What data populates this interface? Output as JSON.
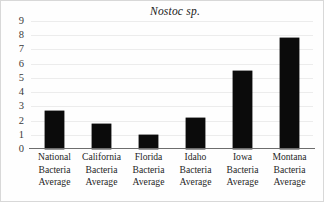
{
  "chart_data": {
    "type": "bar",
    "title": "Nostoc sp.",
    "xlabel": "",
    "ylabel": "",
    "ylim": [
      0,
      9
    ],
    "grid": true,
    "legend": "none",
    "y_ticks": [
      "0",
      "1",
      "2",
      "3",
      "4",
      "5",
      "6",
      "7",
      "8",
      "9"
    ],
    "categories": [
      "National Bacteria Average",
      "California Bacteria Average",
      "Florida Bacteria Average",
      "Idaho Bacteria Average",
      "Iowa Bacteria Average",
      "Montana Bacteria Average"
    ],
    "category_lines": [
      [
        "National",
        "Bacteria",
        "Average"
      ],
      [
        "California",
        "Bacteria",
        "Average"
      ],
      [
        "Florida",
        "Bacteria",
        "Average"
      ],
      [
        "Idaho",
        "Bacteria",
        "Average"
      ],
      [
        "Iowa",
        "Bacteria",
        "Average"
      ],
      [
        "Montana",
        "Bacteria",
        "Average"
      ]
    ],
    "values": [
      2.7,
      1.75,
      1.0,
      2.15,
      5.5,
      7.8
    ],
    "bar_color": "#0b0b0b",
    "gridline_color": "#ececec",
    "axis_color": "#6d6d6d"
  }
}
